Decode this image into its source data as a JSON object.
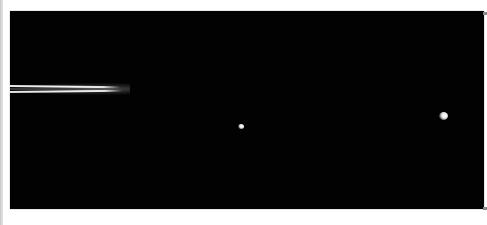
{
  "image": {
    "subject": "Edge-on planetary rings with two small moons against black space",
    "background_color": "#020202",
    "margin_color": "#ffffff",
    "elements": [
      {
        "type": "rings",
        "label": "planetary-rings"
      },
      {
        "type": "moon",
        "label": "moon-small"
      },
      {
        "type": "moon",
        "label": "moon-larger"
      }
    ]
  }
}
